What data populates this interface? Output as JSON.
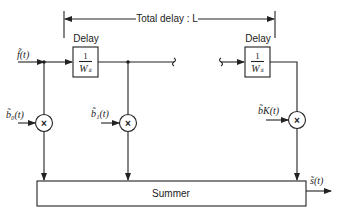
{
  "diagram": {
    "type": "tapped-delay-line block diagram",
    "total_delay_label": "Total delay : L",
    "input_label": "f̃(t)",
    "output_label": "s̃(t)",
    "delay_blocks": [
      {
        "title": "Delay",
        "numerator": "1",
        "denominator": "Wₛ"
      },
      {
        "title": "Delay",
        "numerator": "1",
        "denominator": "Wₛ"
      }
    ],
    "taps": [
      {
        "label": "b̃₀(t)",
        "multiplier_symbol": "×"
      },
      {
        "label": "b̃₁(t)",
        "multiplier_symbol": "×"
      },
      {
        "label": "b̃K(t)",
        "multiplier_symbol": "×"
      }
    ],
    "summer_label": "Summer"
  }
}
